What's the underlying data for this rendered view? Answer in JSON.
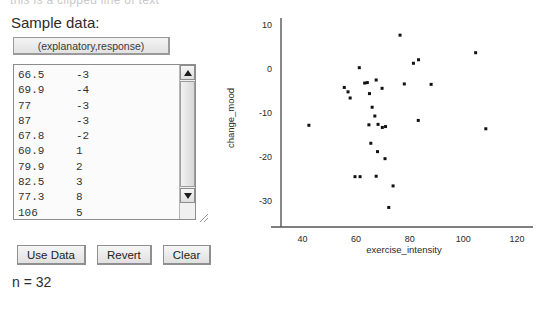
{
  "clipped_header": "this is a clipped line of text",
  "panel": {
    "sample_data_label": "Sample data:",
    "columns_button_label": "(explanatory,response)",
    "n_label": "n = 32",
    "buttons": [
      {
        "name": "use-data",
        "label": "Use Data"
      },
      {
        "name": "revert",
        "label": "Revert"
      },
      {
        "name": "clear",
        "label": "Clear"
      }
    ]
  },
  "data_list": {
    "visible_rows": [
      {
        "x": "66.5",
        "y": "-3"
      },
      {
        "x": "69.9",
        "y": "-4"
      },
      {
        "x": "77",
        "y": "-3"
      },
      {
        "x": "87",
        "y": "-3"
      },
      {
        "x": "67.8",
        "y": "-2"
      },
      {
        "x": "60.9",
        "y": "1"
      },
      {
        "x": "79.9",
        "y": "2"
      },
      {
        "x": "82.5",
        "y": "3"
      },
      {
        "x": "77.3",
        "y": "8"
      },
      {
        "x": "106",
        "y": "5"
      }
    ],
    "scroll_up_icon": "triangle-up-icon",
    "scroll_down_icon": "triangle-down-icon",
    "resize_icon": "resize-grip-icon"
  },
  "chart_data": {
    "type": "scatter",
    "title": "",
    "xlabel": "exercise_intensity",
    "ylabel": "change_mood",
    "xlim": [
      32,
      126
    ],
    "ylim": [
      -34,
      11.5
    ],
    "xticks": [
      40,
      60,
      80,
      100,
      120
    ],
    "yticks": [
      10,
      0,
      -10,
      -20,
      -30
    ],
    "grid": false,
    "legend": null,
    "marker": "square",
    "marker_color": "#111111",
    "marker_size": 3,
    "n": 32,
    "points": [
      {
        "x": 76.4,
        "y": 7.6
      },
      {
        "x": 104.6,
        "y": 3.6
      },
      {
        "x": 83.3,
        "y": 2.0
      },
      {
        "x": 81.4,
        "y": 1.2
      },
      {
        "x": 61.2,
        "y": 0.2
      },
      {
        "x": 67.5,
        "y": -2.6
      },
      {
        "x": 63.2,
        "y": -3.3
      },
      {
        "x": 78.0,
        "y": -3.5
      },
      {
        "x": 88.0,
        "y": -3.6
      },
      {
        "x": 55.6,
        "y": -4.3
      },
      {
        "x": 69.7,
        "y": -4.5
      },
      {
        "x": 57.0,
        "y": -5.3
      },
      {
        "x": 65.0,
        "y": -5.7
      },
      {
        "x": 57.8,
        "y": -6.7
      },
      {
        "x": 66.0,
        "y": -8.8
      },
      {
        "x": 67.0,
        "y": -10.8
      },
      {
        "x": 83.2,
        "y": -11.8
      },
      {
        "x": 42.4,
        "y": -12.9
      },
      {
        "x": 64.8,
        "y": -12.8
      },
      {
        "x": 68.2,
        "y": -12.7
      },
      {
        "x": 69.8,
        "y": -13.4
      },
      {
        "x": 108.4,
        "y": -13.7
      },
      {
        "x": 65.5,
        "y": -17.0
      },
      {
        "x": 68.0,
        "y": -18.9
      },
      {
        "x": 70.8,
        "y": -20.5
      },
      {
        "x": 59.6,
        "y": -24.6
      },
      {
        "x": 61.5,
        "y": -24.6
      },
      {
        "x": 67.5,
        "y": -24.5
      },
      {
        "x": 73.8,
        "y": -26.7
      },
      {
        "x": 72.2,
        "y": -31.6
      },
      {
        "x": 64.2,
        "y": -3.2
      },
      {
        "x": 71.0,
        "y": -13.2
      }
    ]
  }
}
